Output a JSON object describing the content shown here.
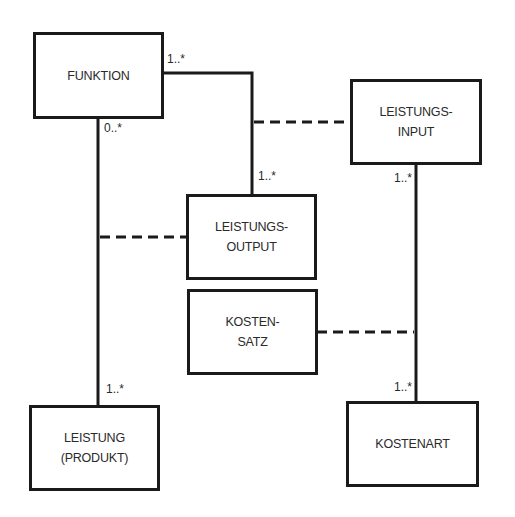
{
  "diagram": {
    "type": "uml-class-diagram",
    "colors": {
      "line": "#1a1a1a",
      "text": "#2a2a2a",
      "background": "#ffffff"
    },
    "classes": [
      {
        "id": "funktion",
        "lines": [
          "FUNKTION"
        ]
      },
      {
        "id": "leistungs-input",
        "lines": [
          "LEISTUNGS-",
          "INPUT"
        ]
      },
      {
        "id": "leistungs-output",
        "lines": [
          "LEISTUNGS-",
          "OUTPUT"
        ]
      },
      {
        "id": "kosten-satz",
        "lines": [
          "KOSTEN-",
          "SATZ"
        ]
      },
      {
        "id": "leistung-produkt",
        "lines": [
          "LEISTUNG",
          "(PRODUKT)"
        ]
      },
      {
        "id": "kostenart",
        "lines": [
          "KOSTENART"
        ]
      }
    ],
    "associations": [
      {
        "from": "funktion",
        "to": "leistungs-output",
        "from_multiplicity": "1..*",
        "to_multiplicity": "1..*"
      },
      {
        "from": "funktion",
        "to": "leistung-produkt",
        "from_multiplicity": "0..*",
        "to_multiplicity": "1..*"
      },
      {
        "from": "leistungs-input",
        "to": "kostenart",
        "from_multiplicity": "1..*",
        "to_multiplicity": "1..*"
      }
    ],
    "association_classes": [
      {
        "class": "leistungs-input",
        "attached_to": "funktion-leistungs-output"
      },
      {
        "class": "leistungs-output",
        "attached_to": "funktion-leistung-produkt"
      },
      {
        "class": "kosten-satz",
        "attached_to": "leistungs-input-kostenart"
      }
    ],
    "multiplicities": {
      "funktion_right": "1..*",
      "funktion_bottom": "0..*",
      "output_top": "1..*",
      "input_bottom": "1..*",
      "leistung_top": "1..*",
      "kostenart_top": "1..*"
    }
  }
}
